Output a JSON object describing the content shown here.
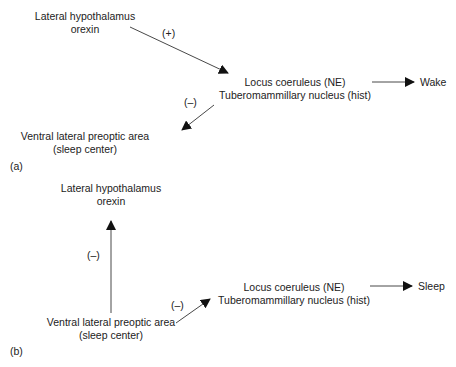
{
  "panel_a": {
    "tag": "(a)",
    "lh": {
      "line1": "Lateral hypothalamus",
      "line2": "orexin"
    },
    "lc": {
      "line1": "Locus coeruleus (NE)",
      "line2": "Tuberomammillary nucleus (hist)"
    },
    "vlpo": {
      "line1": "Ventral lateral preoptic area",
      "line2": "(sleep center)"
    },
    "outcome": "Wake",
    "sign_lh_to_lc": "(+)",
    "sign_lc_to_vlpo": "(–)"
  },
  "panel_b": {
    "tag": "(b)",
    "lh": {
      "line1": "Lateral hypothalamus",
      "line2": "orexin"
    },
    "lc": {
      "line1": "Locus coeruleus (NE)",
      "line2": "Tuberomammillary nucleus (hist)"
    },
    "vlpo": {
      "line1": "Ventral lateral preoptic area",
      "line2": "(sleep center)"
    },
    "outcome": "Sleep",
    "sign_vlpo_to_lh": "(–)",
    "sign_vlpo_to_lc": "(–)"
  }
}
